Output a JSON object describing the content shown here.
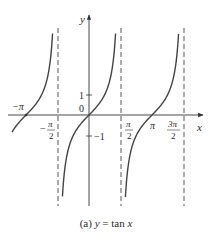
{
  "chart_data": {
    "type": "line",
    "title": "",
    "caption": "(a) y = tan x",
    "caption_parts": {
      "prefix": "(a) ",
      "y": "y",
      "eq": " = tan ",
      "x": "x"
    },
    "function": "tan(x)",
    "xlabel": "x",
    "ylabel": "y",
    "xlim": [
      -4.0,
      5.6
    ],
    "ylim": [
      -4.3,
      4.2
    ],
    "grid": false,
    "legend": null,
    "x_ticks": [
      {
        "value": -3.1416,
        "label": "−π"
      },
      {
        "value": -1.5708,
        "label": "−π/2"
      },
      {
        "value": 1.5708,
        "label": "π/2"
      },
      {
        "value": 3.1416,
        "label": "π"
      },
      {
        "value": 4.7124,
        "label": "3π/2"
      }
    ],
    "y_ticks": [
      {
        "value": 1,
        "label": "1"
      },
      {
        "value": 0,
        "label": "0"
      },
      {
        "value": -1,
        "label": "−1"
      }
    ],
    "asymptotes_x": [
      -1.5708,
      1.5708,
      4.7124
    ],
    "asymptote_style": "dashed",
    "series": [
      {
        "name": "branch (−3π/2, −π/2)",
        "x": [
          -3.84,
          -3.5,
          -3.1416,
          -2.8,
          -2.4,
          -2.0,
          -1.8
        ],
        "y": [
          -0.84,
          -0.37,
          0,
          0.36,
          0.92,
          2.19,
          4.25
        ]
      },
      {
        "name": "branch (−π/2, π/2)",
        "x": [
          -1.37,
          -1.2,
          -0.8,
          -0.4,
          0,
          0.4,
          0.8,
          1.2,
          1.37
        ],
        "y": [
          -4.2,
          -2.57,
          -1.03,
          -0.42,
          0,
          0.42,
          1.03,
          2.57,
          4.2
        ]
      },
      {
        "name": "branch (π/2, 3π/2)",
        "x": [
          1.77,
          1.95,
          2.4,
          2.8,
          3.1416,
          3.5,
          3.9,
          4.3,
          4.51
        ],
        "y": [
          -4.2,
          -2.5,
          -0.92,
          -0.36,
          0,
          0.37,
          0.95,
          2.29,
          4.2
        ]
      }
    ]
  },
  "labels": {
    "x_axis": "x",
    "y_axis": "y",
    "tick_neg_pi": "−π",
    "tick_neg_half_pi_num": "π",
    "tick_neg_half_pi_sign": "−",
    "tick_half_pi_num": "π",
    "tick_den": "2",
    "tick_pi": "π",
    "tick_three_half_pi_num": "3π",
    "tick_one": "1",
    "tick_zero": "0",
    "tick_neg_one": "−1"
  }
}
